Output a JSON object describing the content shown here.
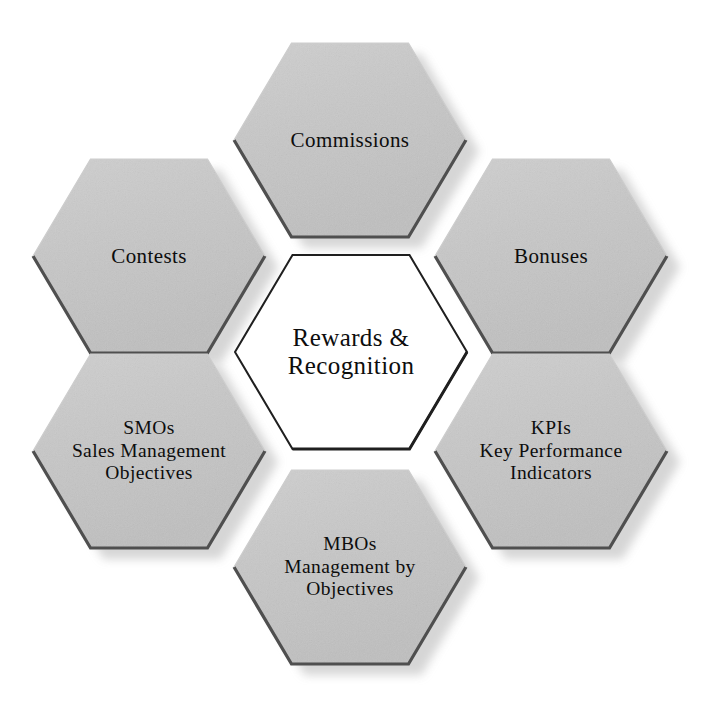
{
  "diagram": {
    "title": "Rewards & Recognition",
    "type": "hexagon-honeycomb",
    "shape_count": 7,
    "colors": {
      "hex_fill": "#c6c6c6",
      "hex_fill_light": "#d2d2d2",
      "hex_edge_dark": "#4a4a4a",
      "hex_shadow": "#e4e4e4",
      "center_fill": "#ffffff",
      "center_stroke": "#1a1a1a",
      "text": "#0d0d0d",
      "background": "#ffffff"
    }
  },
  "center": {
    "id": "rewards-recognition",
    "lines": [
      "Rewards &",
      "Recognition"
    ],
    "line1": "Rewards &",
    "line2": "Recognition"
  },
  "petals": [
    {
      "id": "commissions",
      "position": "top",
      "lines": [
        "Commissions"
      ],
      "line1": "Commissions",
      "line2": "",
      "line3": ""
    },
    {
      "id": "bonuses",
      "position": "top-right",
      "lines": [
        "Bonuses"
      ],
      "line1": "Bonuses",
      "line2": "",
      "line3": ""
    },
    {
      "id": "kpis",
      "position": "bottom-right",
      "lines": [
        "KPIs",
        "Key Performance",
        "Indicators"
      ],
      "line1": "KPIs",
      "line2": "Key Performance",
      "line3": "Indicators"
    },
    {
      "id": "mbos",
      "position": "bottom",
      "lines": [
        "MBOs",
        "Management by",
        "Objectives"
      ],
      "line1": "MBOs",
      "line2": "Management by",
      "line3": "Objectives"
    },
    {
      "id": "smos",
      "position": "bottom-left",
      "lines": [
        "SMOs",
        "Sales Management",
        "Objectives"
      ],
      "line1": "SMOs",
      "line2": "Sales Management",
      "line3": "Objectives"
    },
    {
      "id": "contests",
      "position": "top-left",
      "lines": [
        "Contests"
      ],
      "line1": "Contests",
      "line2": "",
      "line3": ""
    }
  ]
}
